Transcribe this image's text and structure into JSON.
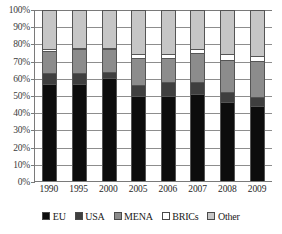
{
  "chart_data": {
    "type": "bar",
    "subtype": "stacked-100-percent",
    "title": "",
    "xlabel": "",
    "ylabel": "",
    "ylim": [
      0,
      100
    ],
    "ytick_labels": [
      "100%",
      "90%",
      "80%",
      "70%",
      "60%",
      "50%",
      "40%",
      "30%",
      "20%",
      "10%",
      "0%"
    ],
    "ytick_values": [
      100,
      90,
      80,
      70,
      60,
      50,
      40,
      30,
      20,
      10,
      0
    ],
    "grid": true,
    "legend_position": "bottom",
    "categories": [
      "1990",
      "1995",
      "2000",
      "2005",
      "2006",
      "2007",
      "2008",
      "2009"
    ],
    "series": [
      {
        "name": "EU",
        "color": "#0d0d0d",
        "values": [
          57,
          57,
          60,
          50,
          50,
          51,
          46,
          44
        ]
      },
      {
        "name": "USA",
        "color": "#3f3f3f",
        "values": [
          6,
          6,
          4,
          6,
          8,
          7,
          6,
          5
        ]
      },
      {
        "name": "MENA",
        "color": "#8c8c8c",
        "values": [
          13,
          14,
          13,
          16,
          14,
          17,
          19,
          21
        ]
      },
      {
        "name": "BRICs",
        "color": "#ffffff",
        "values": [
          1,
          1,
          1,
          2,
          2,
          2,
          3,
          3
        ]
      },
      {
        "name": "Other",
        "color": "#c6c6c6",
        "values": [
          23,
          22,
          22,
          26,
          26,
          23,
          26,
          27
        ]
      }
    ]
  },
  "legend": {
    "items": [
      {
        "label": "EU",
        "color": "#0d0d0d"
      },
      {
        "label": "USA",
        "color": "#3f3f3f"
      },
      {
        "label": "MENA",
        "color": "#8c8c8c"
      },
      {
        "label": "BRICs",
        "color": "#ffffff"
      },
      {
        "label": "Other",
        "color": "#c6c6c6"
      }
    ]
  }
}
